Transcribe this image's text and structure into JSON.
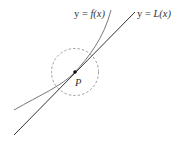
{
  "diagram": {
    "labels": {
      "curve": "y = f(x)",
      "curve_prefix": "y = ",
      "curve_fn": "f(x)",
      "line": "y = L(x)",
      "line_prefix": "y = ",
      "line_fn": "L(x)",
      "point": "P"
    },
    "colors": {
      "curve": "#777777",
      "line": "#333333",
      "circle": "#888888",
      "point": "#111111",
      "text": "#333333"
    }
  }
}
